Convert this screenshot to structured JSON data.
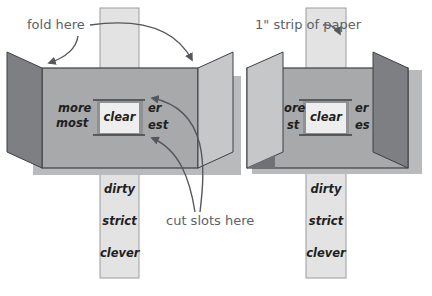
{
  "labels": {
    "fold_here": "fold here",
    "strip_of_paper": "1\" strip of paper",
    "cut_slots_here": "cut slots here"
  },
  "left_figure": {
    "prefix_top": "more",
    "prefix_bottom": "most",
    "window_word": "clear",
    "suffix_top": "er",
    "suffix_bottom": "est",
    "strip_words": [
      "dirty",
      "strict",
      "clever"
    ]
  },
  "right_figure": {
    "prefix_top": "ore",
    "prefix_bottom": "st",
    "window_word": "clear",
    "suffix_top": "er",
    "suffix_bottom": "es",
    "strip_words": [
      "dirty",
      "strict",
      "clever"
    ]
  },
  "colors": {
    "panel": "#a7a9ab",
    "panel_outline": "#3e4045",
    "dark_flap": "#7d7f82",
    "light_flap": "#c6c7c9",
    "strip": "#e3e3e4",
    "strip_outline": "#9a9c9e",
    "window": "#eeeeee",
    "shadow": "#b9babb",
    "arrow": "#54575b"
  }
}
